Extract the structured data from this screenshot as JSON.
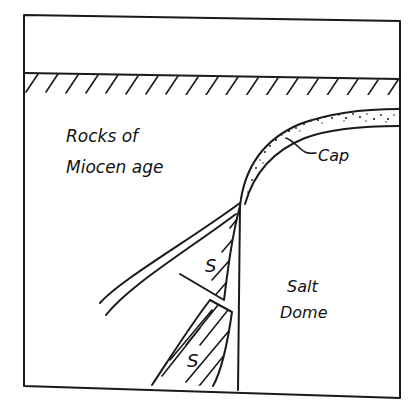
{
  "diagram": {
    "title": "",
    "labels": {
      "rocks_line1": "Rocks of",
      "rocks_line2": "Miocen age",
      "cap": "Cap",
      "salt_line1": "Salt",
      "salt_line2": "Dome",
      "s_upper": "S",
      "s_lower": "S"
    },
    "colors": {
      "ink": "#1a1a1a",
      "background": "#ffffff"
    }
  }
}
